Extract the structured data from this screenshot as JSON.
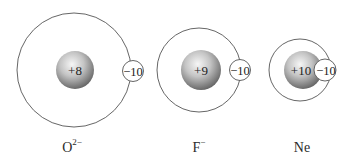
{
  "species": [
    {
      "name": "O",
      "charge_superscript": "2−",
      "nucleus_charge": "+8",
      "electron_charge": "−10",
      "shell": {
        "cx": 74,
        "cy": 70,
        "r": 57
      },
      "nucleus": {
        "cx": 75,
        "cy": 70,
        "r": 19
      },
      "electron": {
        "cx": 133,
        "cy": 71,
        "r": 10.5
      },
      "label_pos": {
        "x": 72,
        "y": 150
      }
    },
    {
      "name": "F",
      "charge_superscript": "−",
      "nucleus_charge": "+9",
      "electron_charge": "−10",
      "shell": {
        "cx": 199,
        "cy": 70,
        "r": 42
      },
      "nucleus": {
        "cx": 201,
        "cy": 70,
        "r": 20
      },
      "electron": {
        "cx": 240,
        "cy": 70,
        "r": 10.5
      },
      "label_pos": {
        "x": 200,
        "y": 150
      }
    },
    {
      "name": "Ne",
      "charge_superscript": "",
      "nucleus_charge": "+10",
      "electron_charge": "−10",
      "shell": {
        "cx": 300,
        "cy": 70,
        "r": 31
      },
      "nucleus": {
        "cx": 303,
        "cy": 70,
        "r": 19
      },
      "electron": {
        "cx": 325,
        "cy": 70,
        "r": 11
      },
      "label_pos": {
        "x": 302,
        "y": 150
      }
    }
  ],
  "colors": {
    "shell_stroke": "#555555",
    "nucleus_light": "#f2f2f2",
    "nucleus_dark": "#6a6a6a",
    "electron_fill": "#ffffff"
  }
}
